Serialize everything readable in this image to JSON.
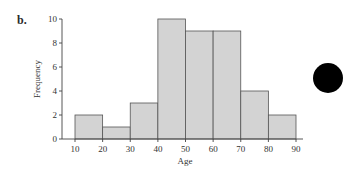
{
  "panel": {
    "label": "b."
  },
  "chart_data": {
    "type": "bar",
    "subtype": "histogram",
    "title": "",
    "xlabel": "Age",
    "ylabel": "Frequency",
    "bins": [
      [
        10,
        20
      ],
      [
        20,
        30
      ],
      [
        30,
        40
      ],
      [
        40,
        50
      ],
      [
        50,
        60
      ],
      [
        60,
        70
      ],
      [
        70,
        80
      ],
      [
        80,
        90
      ]
    ],
    "categories": [
      "10-20",
      "20-30",
      "30-40",
      "40-50",
      "50-60",
      "60-70",
      "70-80",
      "80-90"
    ],
    "values": [
      2,
      1,
      3,
      10,
      9,
      9,
      4,
      2
    ],
    "x_ticks": [
      10,
      20,
      30,
      40,
      50,
      60,
      70,
      80,
      90
    ],
    "y_ticks": [
      0,
      2,
      4,
      6,
      8,
      10
    ],
    "xlim": [
      10,
      90
    ],
    "ylim": [
      0,
      10
    ],
    "grid": false,
    "legend": null,
    "bar_color": "#d3d3d3",
    "edge_color": "#555555"
  },
  "marker": {
    "shape": "circle",
    "color": "#000000"
  }
}
